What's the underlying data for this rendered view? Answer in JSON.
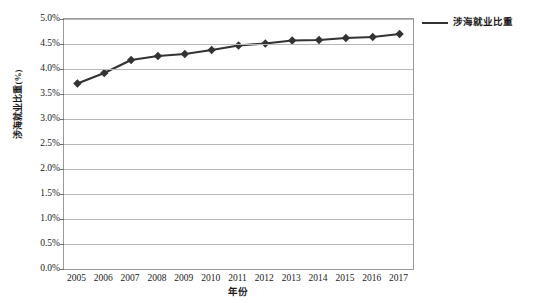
{
  "chart_data": {
    "type": "line",
    "title": "",
    "xlabel": "年份",
    "ylabel": "涉海就业比重(%)",
    "categories": [
      "2005",
      "2006",
      "2007",
      "2008",
      "2009",
      "2010",
      "2011",
      "2012",
      "2013",
      "2014",
      "2015",
      "2016",
      "2017"
    ],
    "series": [
      {
        "name": "涉海就业比重",
        "values": [
          3.71,
          3.92,
          4.18,
          4.26,
          4.3,
          4.38,
          4.47,
          4.51,
          4.57,
          4.58,
          4.62,
          4.64,
          4.7
        ]
      }
    ],
    "ylim": [
      0.0,
      5.0
    ],
    "ytick_values": [
      0.0,
      0.5,
      1.0,
      1.5,
      2.0,
      2.5,
      3.0,
      3.5,
      4.0,
      4.5,
      5.0
    ],
    "ytick_labels": [
      "0.0%",
      "0.5%",
      "1.0%",
      "1.5%",
      "2.0%",
      "2.5%",
      "3.0%",
      "3.5%",
      "4.0%",
      "4.5%",
      "5.0%"
    ],
    "grid": true,
    "legend_position": "right",
    "marker": "diamond",
    "line_color": "#333333",
    "marker_color": "#333333",
    "grid_color": "#b8b8b8",
    "frame_color": "#9a9a9a",
    "background_color": "#ffffff"
  },
  "legend": {
    "entries": [
      {
        "label": "涉海就业比重",
        "color": "#333333"
      }
    ]
  }
}
